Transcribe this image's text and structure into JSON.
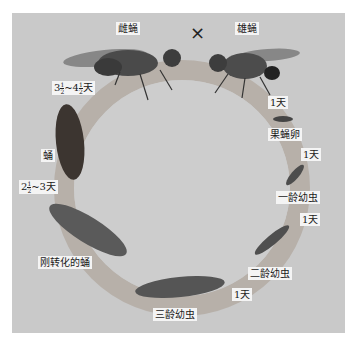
{
  "diagram": {
    "cross_symbol": "×",
    "stages": {
      "female_fly": "雌蝇",
      "male_fly": "雄蝇",
      "egg": "果蝇卵",
      "larva_1": "一龄幼虫",
      "larva_2": "二龄幼虫",
      "larva_3": "三龄幼虫",
      "prepupa": "刚转化的蛹",
      "pupa": "蛹"
    },
    "durations": {
      "adult_to_egg": "1天",
      "egg_to_larva1": "1天",
      "larva1_to_larva2": "1天",
      "larva2_to_larva3": "1天",
      "larva3_to_pupa": {
        "whole": "2",
        "num": "1",
        "den": "2",
        "suffix": "~3天"
      },
      "pupa_to_adult": {
        "whole_a": "3",
        "num_a": "1",
        "den_a": "2",
        "sep": "~",
        "whole_b": "4",
        "num_b": "1",
        "den_b": "2",
        "suffix": "天"
      }
    },
    "colors": {
      "background": "#c9c9c9",
      "ring": "#b3a89f",
      "label_bg": "#f4f4f4"
    }
  }
}
